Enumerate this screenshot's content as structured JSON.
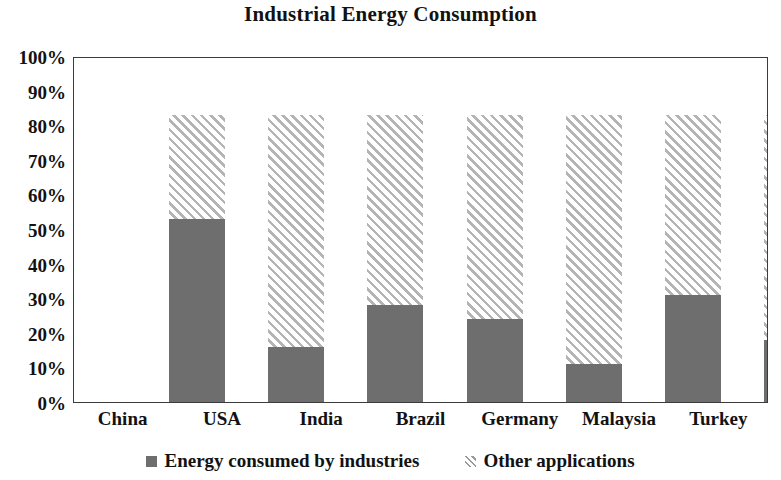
{
  "chart_data": {
    "type": "bar",
    "subtype": "stacked-percentage-column",
    "title": "Industrial Energy Consumption",
    "xlabel": "",
    "ylabel": "",
    "ylim": [
      0,
      100
    ],
    "grid": false,
    "legend_position": "bottom",
    "categories": [
      "China",
      "USA",
      "India",
      "Brazil",
      "Germany",
      "Malaysia",
      "Turkey"
    ],
    "ytick_labels": [
      "100%",
      "90%",
      "80%",
      "70%",
      "60%",
      "50%",
      "40%",
      "30%",
      "20%",
      "10%",
      "0%"
    ],
    "ytick_values": [
      100,
      90,
      80,
      70,
      60,
      50,
      40,
      30,
      20,
      10,
      0
    ],
    "series": [
      {
        "name": "Energy consumed by industries",
        "pattern": "solid",
        "color": "#6e6e6e",
        "values": [
          70,
          33,
          45,
          41,
          28,
          48,
          35
        ]
      },
      {
        "name": "Other applications",
        "pattern": "diagonal-hatch",
        "color": "#b4b4b4",
        "values": [
          30,
          67,
          55,
          59,
          72,
          52,
          65
        ]
      }
    ]
  },
  "legend": {
    "items": [
      {
        "label": "Energy consumed by industries",
        "swatch": "solid-gray-square-icon"
      },
      {
        "label": "Other applications",
        "swatch": "diagonal-hatch-square-icon"
      }
    ]
  },
  "colors": {
    "industry_fill": "#6e6e6e",
    "hatch_line": "#b4b4b4",
    "plot_border": "#3c3c3c",
    "text": "#121212",
    "background": "#ffffff"
  }
}
